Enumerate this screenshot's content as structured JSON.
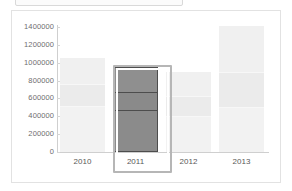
{
  "panel": {
    "top_strip_label": ""
  },
  "chart_data": {
    "type": "bar",
    "subtype": "stacked-bar",
    "title": "",
    "xlabel": "",
    "ylabel": "",
    "ylim": [
      0,
      1400000
    ],
    "grid": false,
    "legend": "none",
    "categories": [
      "2010",
      "2011",
      "2012",
      "2013"
    ],
    "ytick_labels": [
      "1400000",
      "1200000",
      "1000000",
      "800000",
      "600000",
      "400000",
      "200000",
      "0"
    ],
    "ytick_values": [
      1400000,
      1200000,
      1000000,
      800000,
      600000,
      400000,
      200000,
      0
    ],
    "series": [
      {
        "name": "segment-bottom",
        "values": [
          500000,
          455000,
          395000,
          490000
        ]
      },
      {
        "name": "segment-middle",
        "values": [
          265000,
          220000,
          235000,
          410000
        ]
      },
      {
        "name": "segment-top",
        "values": [
          285000,
          280000,
          270000,
          510000
        ]
      }
    ],
    "totals": [
      1050000,
      955000,
      900000,
      1410000
    ],
    "selected_category": "2011",
    "colors": {
      "dimmed_bar": "#f0f0f0",
      "selected_bar": "#8b8b8b",
      "selected_bar_outline": "#4d4d4d",
      "selection_frame": "#b6b6b6",
      "axis": "#cfcfcf",
      "tick_text": "#6e6e6e",
      "panel_border": "#e2e2e2",
      "background": "#ffffff"
    }
  }
}
